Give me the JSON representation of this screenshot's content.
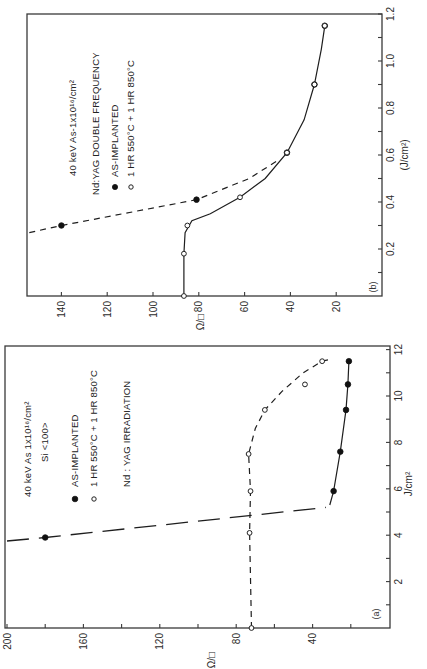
{
  "chart_data": [
    {
      "panel": "a",
      "type": "scatter",
      "orientation": "rotated 90° counter-clockwise",
      "panel_label": "(a)",
      "xlabel": "J/cm²",
      "ylabel": "Ω/□",
      "xlim": [
        0,
        12
      ],
      "ylim": [
        0,
        200
      ],
      "xticks": [
        "2",
        "4",
        "6",
        "8",
        "10",
        "12"
      ],
      "yticks": [
        "200",
        "160",
        "120",
        "80",
        "40"
      ],
      "legend_lines": [
        "40 keV As 1x10¹⁶/cm²",
        "Si <100>",
        "AS-IMPLANTED",
        "1 HR 550°C + 1 HR 850°C",
        "Nd : YAG IRRADIATION"
      ],
      "series": [
        {
          "name": "AS-IMPLANTED",
          "marker": "filled-circle",
          "x": [
            3.9,
            5.9,
            7.6,
            9.4,
            10.5,
            11.5
          ],
          "y": [
            180,
            29,
            25.5,
            22.5,
            21.5,
            21
          ]
        },
        {
          "name": "1 HR 550°C + 1 HR 850°C",
          "marker": "open-circle",
          "x": [
            0,
            4.1,
            5.9,
            7.5,
            9.4,
            10.5,
            11.5
          ],
          "y": [
            72,
            73,
            72.5,
            73.5,
            65,
            44,
            35
          ]
        }
      ]
    },
    {
      "panel": "b",
      "type": "scatter",
      "orientation": "rotated 90° counter-clockwise",
      "panel_label": "(b)",
      "xlabel": "(J/cm²)",
      "ylabel": "Ω/□",
      "xlim": [
        0,
        1.2
      ],
      "ylim": [
        0,
        154
      ],
      "xticks": [
        "0.2",
        "0.4",
        "0.6",
        "0.8",
        "1.0",
        "1.2"
      ],
      "yticks": [
        "140",
        "120",
        "100",
        "80",
        "60",
        "40",
        "20"
      ],
      "legend_lines": [
        "40 keV As-1x10¹⁶/cm²",
        "Nd:YAG DOUBLE FREQUENCY",
        "AS-IMPLANTED",
        "1 HR 550°C + 1 HR 850°C"
      ],
      "series": [
        {
          "name": "AS-IMPLANTED",
          "marker": "filled-circle",
          "x": [
            0.3,
            0.41,
            0.61,
            0.9,
            1.15
          ],
          "y": [
            140,
            81,
            41.5,
            29.5,
            25
          ]
        },
        {
          "name": "1 HR 550°C + 1 HR 850°C",
          "marker": "open-circle",
          "x": [
            0,
            0.18,
            0.3,
            0.42,
            0.61,
            0.9,
            1.15
          ],
          "y": [
            86.5,
            86.5,
            85,
            62,
            41.5,
            29.5,
            25
          ]
        }
      ]
    }
  ]
}
